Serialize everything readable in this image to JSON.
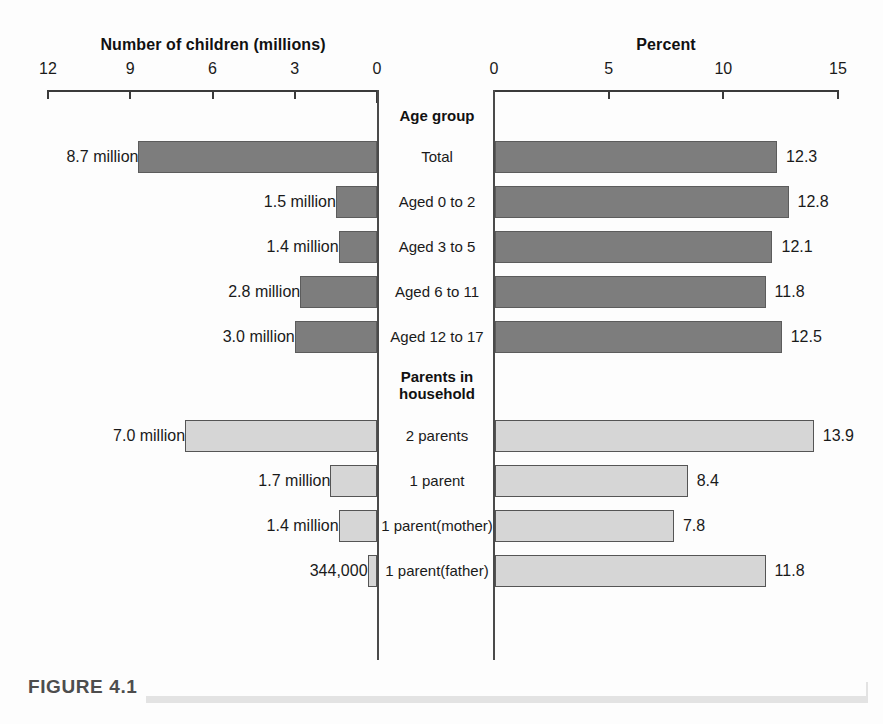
{
  "figure": {
    "caption_label": "FIGURE 4.1"
  },
  "chart_data": {
    "type": "bar",
    "title": "",
    "orientation": "horizontal",
    "layout": "back-to-back paired panels sharing a centered category column",
    "grid": false,
    "legend": null,
    "panels": [
      {
        "id": "left",
        "axis_title": "Number of children (millions)",
        "direction": "right-to-left",
        "ticks": [
          12,
          9,
          6,
          3,
          0
        ],
        "tick_labels": [
          "12",
          "9",
          "6",
          "3",
          "0"
        ],
        "axis_range": [
          0,
          12
        ],
        "value_suffix": "million"
      },
      {
        "id": "right",
        "axis_title": "Percent",
        "direction": "left-to-right",
        "ticks": [
          0,
          5,
          10,
          15
        ],
        "tick_labels": [
          "0",
          "5",
          "10",
          "15"
        ],
        "axis_range": [
          0,
          15
        ],
        "value_suffix": "%"
      }
    ],
    "groups": [
      {
        "header": "Age group",
        "header_lines": [
          "Age group"
        ],
        "bar_style": "dark",
        "rows": [
          {
            "label": "Total",
            "label_lines": [
              "Total"
            ],
            "count": 8.7,
            "count_label": "8.7 million",
            "percent": 12.3,
            "percent_label": "12.3"
          },
          {
            "label": "Aged 0 to 2",
            "label_lines": [
              "Aged 0 to 2"
            ],
            "count": 1.5,
            "count_label": "1.5 million",
            "percent": 12.8,
            "percent_label": "12.8"
          },
          {
            "label": "Aged 3 to 5",
            "label_lines": [
              "Aged 3 to 5"
            ],
            "count": 1.4,
            "count_label": "1.4 million",
            "percent": 12.1,
            "percent_label": "12.1"
          },
          {
            "label": "Aged 6 to 11",
            "label_lines": [
              "Aged 6 to 11"
            ],
            "count": 2.8,
            "count_label": "2.8 million",
            "percent": 11.8,
            "percent_label": "11.8"
          },
          {
            "label": "Aged 12 to 17",
            "label_lines": [
              "Aged 12 to 17"
            ],
            "count": 3.0,
            "count_label": "3.0 million",
            "percent": 12.5,
            "percent_label": "12.5"
          }
        ]
      },
      {
        "header": "Parents in household",
        "header_lines": [
          "Parents in",
          "household"
        ],
        "bar_style": "light",
        "rows": [
          {
            "label": "2 parents",
            "label_lines": [
              "2 parents"
            ],
            "count": 7.0,
            "count_label": "7.0 million",
            "percent": 13.9,
            "percent_label": "13.9"
          },
          {
            "label": "1 parent",
            "label_lines": [
              "1 parent"
            ],
            "count": 1.7,
            "count_label": "1.7 million",
            "percent": 8.4,
            "percent_label": "8.4"
          },
          {
            "label": "1 parent (mother)",
            "label_lines": [
              "1 parent",
              "(mother)"
            ],
            "count": 1.4,
            "count_label": "1.4 million",
            "percent": 7.8,
            "percent_label": "7.8"
          },
          {
            "label": "1 parent (father)",
            "label_lines": [
              "1 parent",
              "(father)"
            ],
            "count": 0.344,
            "count_label": "344,000",
            "percent": 11.8,
            "percent_label": "11.8"
          }
        ]
      }
    ],
    "colors": {
      "bar_dark_fill": "#7d7d7d",
      "bar_dark_stroke": "#5c5c5c",
      "bar_light_fill": "#d6d6d6",
      "bar_light_stroke": "#555555",
      "axis": "#3a3a3a",
      "text": "#1a1a1a",
      "caption_rule": "#e3e3e3",
      "background": "#fdfdfd"
    }
  }
}
